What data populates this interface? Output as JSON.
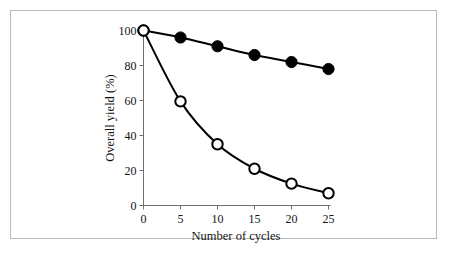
{
  "figure": {
    "background_color": "#ffffff",
    "frame_color": "#b9b9b9",
    "axis_color": "#6e6e6e",
    "ink_color": "#000000"
  },
  "chart_data": {
    "type": "line",
    "title": "",
    "subtitle": "",
    "xlabel": "Number of cycles",
    "ylabel": "Overall yield (%)",
    "xlim": [
      0,
      25
    ],
    "ylim": [
      0,
      100
    ],
    "xticks": [
      0,
      5,
      10,
      15,
      20,
      25
    ],
    "yticks": [
      0,
      20,
      40,
      60,
      80,
      100
    ],
    "xtick_labels": [
      "0",
      "5",
      "10",
      "15",
      "20",
      "25"
    ],
    "ytick_labels": [
      "0",
      "20",
      "40",
      "60",
      "80",
      "100"
    ],
    "grid": false,
    "legend": false,
    "legend_position": "none",
    "x": [
      0,
      5,
      10,
      15,
      20,
      25
    ],
    "series": [
      {
        "name": "99% yield per cycle",
        "marker": "filled-circle",
        "marker_color": "#000000",
        "line_color": "#000000",
        "values": [
          100,
          96,
          91,
          86,
          82,
          78
        ]
      },
      {
        "name": "90% yield per cycle",
        "marker": "open-circle",
        "marker_color": "#ffffff",
        "line_color": "#000000",
        "values": [
          100,
          59.5,
          35,
          21,
          12.5,
          7
        ]
      }
    ],
    "annotations": []
  }
}
